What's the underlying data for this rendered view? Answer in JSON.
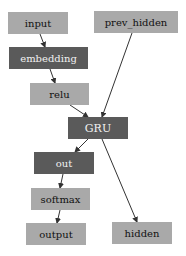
{
  "diagram": {
    "type": "computation-graph",
    "colors": {
      "light_node": "#a9a9a9",
      "dark_node": "#5a5a5a",
      "edge": "#333333"
    },
    "nodes": [
      {
        "id": "input",
        "label": "input",
        "style": "light"
      },
      {
        "id": "prev_hidden",
        "label": "prev_hidden",
        "style": "light"
      },
      {
        "id": "embedding",
        "label": "embedding",
        "style": "dark"
      },
      {
        "id": "relu",
        "label": "relu",
        "style": "light"
      },
      {
        "id": "gru",
        "label": "GRU",
        "style": "dark"
      },
      {
        "id": "out",
        "label": "out",
        "style": "dark"
      },
      {
        "id": "softmax",
        "label": "softmax",
        "style": "light"
      },
      {
        "id": "output",
        "label": "output",
        "style": "light"
      },
      {
        "id": "hidden",
        "label": "hidden",
        "style": "light"
      }
    ],
    "edges": [
      {
        "from": "input",
        "to": "embedding"
      },
      {
        "from": "embedding",
        "to": "relu"
      },
      {
        "from": "relu",
        "to": "GRU"
      },
      {
        "from": "prev_hidden",
        "to": "GRU"
      },
      {
        "from": "GRU",
        "to": "out"
      },
      {
        "from": "GRU",
        "to": "hidden"
      },
      {
        "from": "out",
        "to": "softmax"
      },
      {
        "from": "softmax",
        "to": "output"
      }
    ]
  }
}
